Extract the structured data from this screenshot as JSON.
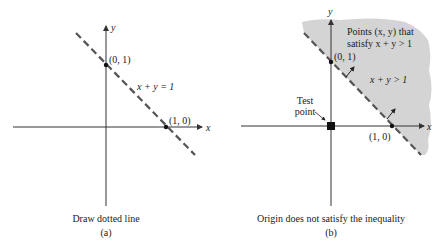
{
  "panel_a": {
    "axis_x_label": "x",
    "axis_y_label": "y",
    "point_y_intercept": "(0, 1)",
    "point_x_intercept": "(1, 0)",
    "line_label": "x + y = 1",
    "caption": "Draw dotted line",
    "sublabel": "(a)"
  },
  "panel_b": {
    "axis_x_label": "x",
    "axis_y_label": "y",
    "point_y_intercept": "(0, 1)",
    "point_x_intercept": "(1, 0)",
    "region_label_line1": "Points (x, y) that",
    "region_label_line2": "satisfy x + y > 1",
    "inequality_label": "x + y > 1",
    "test_point_line1": "Test",
    "test_point_line2": "point",
    "caption": "Origin does not satisfy the inequality",
    "sublabel": "(b)",
    "shade_color": "#d4d4d4"
  },
  "colors": {
    "axis": "#333333",
    "dashed_line": "#555555"
  }
}
